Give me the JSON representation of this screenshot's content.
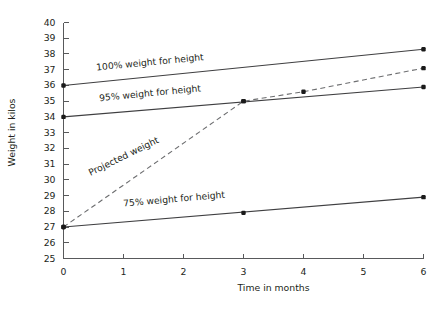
{
  "chart_data": {
    "type": "line",
    "title": "",
    "xlabel": "Time in months",
    "ylabel": "Weight in kilos",
    "xlim": [
      0,
      6
    ],
    "ylim": [
      25,
      40
    ],
    "x_ticks": [
      "0",
      "1",
      "2",
      "3",
      "4",
      "5",
      "6"
    ],
    "y_ticks": [
      "25",
      "26",
      "27",
      "28",
      "29",
      "30",
      "31",
      "32",
      "33",
      "34",
      "35",
      "36",
      "37",
      "38",
      "39",
      "40"
    ],
    "grid": false,
    "legend_position": "inline-annotations",
    "x": [
      0,
      1,
      2,
      3,
      4,
      5,
      6
    ],
    "series": [
      {
        "name": "100% weight for height",
        "label": "100% weight for height",
        "style": "solid",
        "x": [
          0,
          6
        ],
        "values": [
          36.0,
          38.3
        ],
        "markers": [
          {
            "x": 0,
            "y": 36.0
          },
          {
            "x": 6,
            "y": 38.3
          }
        ]
      },
      {
        "name": "95% weight for height",
        "label": "95% weight for height",
        "style": "solid",
        "x": [
          0,
          6
        ],
        "values": [
          34.0,
          35.9
        ],
        "markers": [
          {
            "x": 0,
            "y": 34.0
          },
          {
            "x": 3,
            "y": 35.0
          },
          {
            "x": 6,
            "y": 35.9
          }
        ]
      },
      {
        "name": "Projected weight",
        "label": "Projected weight",
        "style": "dashed",
        "x": [
          0,
          3,
          4,
          6
        ],
        "values": [
          27.0,
          35.0,
          35.6,
          37.1
        ],
        "markers": [
          {
            "x": 0,
            "y": 27.0
          },
          {
            "x": 3,
            "y": 35.0
          },
          {
            "x": 4,
            "y": 35.6
          },
          {
            "x": 6,
            "y": 37.1
          }
        ]
      },
      {
        "name": "75% weight for height",
        "label": "75% weight for height",
        "style": "solid",
        "x": [
          0,
          6
        ],
        "values": [
          27.0,
          28.9
        ],
        "markers": [
          {
            "x": 0,
            "y": 27.0
          },
          {
            "x": 3,
            "y": 27.9
          },
          {
            "x": 6,
            "y": 28.9
          }
        ]
      }
    ],
    "annotations": [
      {
        "text": "100% weight for height",
        "x": 0.55,
        "y": 36.95,
        "rotation": -5.5
      },
      {
        "text": "95% weight for height",
        "x": 0.6,
        "y": 35.0,
        "rotation": -5.5
      },
      {
        "text": "Projected weight",
        "x": 0.45,
        "y": 30.25,
        "rotation": -26
      },
      {
        "text": "75% weight for height",
        "x": 1.0,
        "y": 28.3,
        "rotation": -5.0
      }
    ]
  }
}
